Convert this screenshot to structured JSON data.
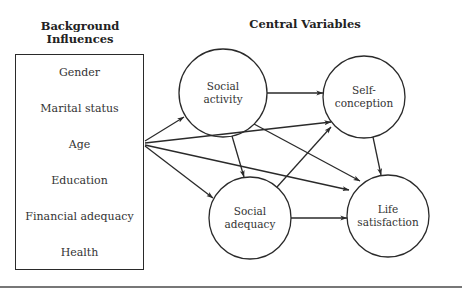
{
  "headings": {
    "background": "Background Influences",
    "background_line1": "Background",
    "background_line2": "Influences",
    "central": "Central Variables"
  },
  "background_influences": [
    "Gender",
    "Marital status",
    "Age",
    "Education",
    "Financial adequacy",
    "Health"
  ],
  "nodes": [
    {
      "id": "social_activity",
      "line1": "Social",
      "line2": "activity",
      "cx": 223,
      "cy": 93,
      "r": 44
    },
    {
      "id": "self_conception",
      "line1": "Self-",
      "line2": "conception",
      "cx": 364,
      "cy": 97,
      "r": 41
    },
    {
      "id": "social_adequacy",
      "line1": "Social",
      "line2": "adequacy",
      "cx": 250,
      "cy": 218,
      "r": 41
    },
    {
      "id": "life_satisfaction",
      "line1": "Life",
      "line2": "satisfaction",
      "cx": 388,
      "cy": 216,
      "r": 41
    }
  ],
  "edges": [
    {
      "from": "background_influences",
      "to": "social_activity"
    },
    {
      "from": "background_influences",
      "to": "self_conception"
    },
    {
      "from": "background_influences",
      "to": "life_satisfaction"
    },
    {
      "from": "background_influences",
      "to": "social_adequacy"
    },
    {
      "from": "social_activity",
      "to": "self_conception"
    },
    {
      "from": "social_activity",
      "to": "social_adequacy"
    },
    {
      "from": "social_activity",
      "to": "life_satisfaction"
    },
    {
      "from": "social_adequacy",
      "to": "self_conception"
    },
    {
      "from": "social_adequacy",
      "to": "life_satisfaction"
    },
    {
      "from": "self_conception",
      "to": "life_satisfaction"
    }
  ],
  "colors": {
    "stroke": "#2a2a2a",
    "background": "#ffffff",
    "rule": "#777777"
  }
}
